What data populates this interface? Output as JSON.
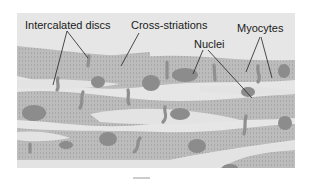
{
  "figure": {
    "labels": {
      "intercalated_discs": "Intercalated discs",
      "cross_striations": "Cross-striations",
      "nuclei": "Nuclei",
      "myocytes": "Myocytes"
    },
    "colors": {
      "background": "#e6e6e6",
      "cell": "#b9b9b9",
      "striation": "#a2a2a2",
      "nucleus": "#8a8a8a",
      "disc": "#8f8f8f",
      "leader": "#222222"
    }
  }
}
